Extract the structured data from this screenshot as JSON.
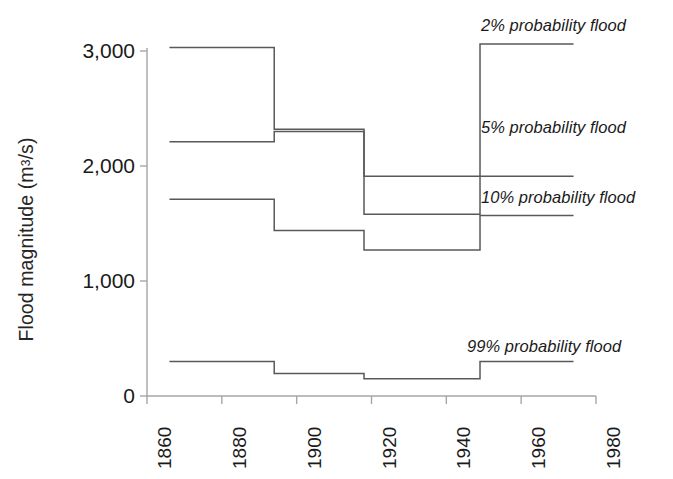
{
  "chart_data": {
    "type": "line",
    "line_style": "step-post",
    "title": "",
    "xlabel": "",
    "ylabel": "Flood magnitude (m3/s)",
    "ylabel_display": "Flood magnitude (m",
    "ylabel_sup": "3",
    "ylabel_tail": "/s)",
    "xlim": [
      1860,
      1980
    ],
    "ylim": [
      0,
      3100
    ],
    "grid": false,
    "legend_position": "inline-annotations",
    "x_ticks": [
      1860,
      1880,
      1900,
      1920,
      1940,
      1960,
      1980
    ],
    "x_tick_labels": [
      "1860",
      "1880",
      "1900",
      "1920",
      "1940",
      "1960",
      "1980"
    ],
    "y_ticks": [
      0,
      1000,
      2000,
      3000
    ],
    "y_tick_labels": [
      "0",
      "1,000",
      "2,000",
      "3,000"
    ],
    "step_breakpoints": [
      1866,
      1894,
      1918,
      1949,
      1974
    ],
    "series": [
      {
        "name": "2% probability flood",
        "annotation": "2% probability flood",
        "x": [
          1866,
          1894,
          1918,
          1949,
          1974
        ],
        "values": [
          3030,
          2320,
          1910,
          3060,
          3060
        ],
        "segment_values": [
          3030,
          2320,
          1910,
          3060
        ],
        "annot_left": 481,
        "annot_top": 16
      },
      {
        "name": "5% probability flood",
        "annotation": "5% probability flood",
        "x": [
          1866,
          1894,
          1918,
          1949,
          1974
        ],
        "values": [
          2210,
          2300,
          1580,
          1910,
          1910
        ],
        "segment_values": [
          2210,
          2300,
          1580,
          1910
        ],
        "annot_left": 481,
        "annot_top": 118
      },
      {
        "name": "10% probability flood",
        "annotation": "10% probability flood",
        "x": [
          1866,
          1894,
          1918,
          1949,
          1974
        ],
        "values": [
          1710,
          1440,
          1270,
          1570,
          1570
        ],
        "segment_values": [
          1710,
          1440,
          1270,
          1570
        ],
        "annot_left": 481,
        "annot_top": 188
      },
      {
        "name": "99% probability flood",
        "annotation": "99% probability flood",
        "x": [
          1866,
          1894,
          1918,
          1949,
          1974
        ],
        "values": [
          300,
          195,
          150,
          300,
          300
        ],
        "segment_values": [
          300,
          195,
          150,
          300
        ],
        "annot_left": 467,
        "annot_top": 337
      }
    ],
    "colors": {
      "line": "#595959",
      "axis": "#a6a6a6",
      "text": "#1a1a1a"
    }
  }
}
